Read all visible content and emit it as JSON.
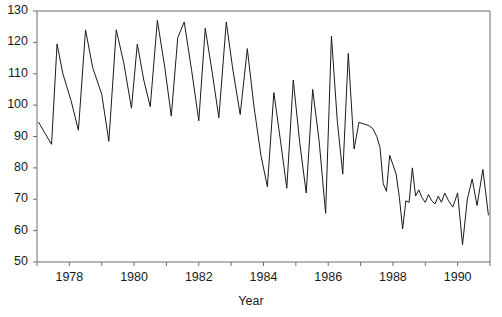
{
  "chart_data": {
    "type": "line",
    "title": "",
    "xlabel": "Year",
    "ylabel": "",
    "xlim": [
      1977.0,
      1991.0
    ],
    "ylim": [
      50,
      130
    ],
    "grid": false,
    "legend": null,
    "y_ticks": [
      50,
      60,
      70,
      80,
      90,
      100,
      110,
      120,
      130
    ],
    "x_ticks_major": [
      1978,
      1980,
      1982,
      1984,
      1986,
      1988,
      1990
    ],
    "x_ticks_minor": [
      1977,
      1979,
      1981,
      1983,
      1985,
      1987,
      1989,
      1991
    ],
    "x_tick_labels": [
      "1978",
      "1980",
      "1982",
      "1984",
      "1986",
      "1988",
      "1990"
    ],
    "y_tick_labels": [
      "50",
      "60",
      "70",
      "80",
      "90",
      "100",
      "110",
      "120",
      "130"
    ],
    "line_color": "#1a1a1a",
    "line_width": 1.0,
    "series": [
      {
        "name": "series-1",
        "x": [
          1977.05,
          1977.25,
          1977.45,
          1977.62,
          1977.8,
          1978.05,
          1978.28,
          1978.5,
          1978.72,
          1979.0,
          1979.22,
          1979.45,
          1979.68,
          1979.92,
          1980.1,
          1980.3,
          1980.5,
          1980.72,
          1980.95,
          1981.15,
          1981.35,
          1981.55,
          1981.78,
          1982.0,
          1982.2,
          1982.42,
          1982.62,
          1982.85,
          1983.05,
          1983.28,
          1983.5,
          1983.7,
          1983.92,
          1984.12,
          1984.32,
          1984.52,
          1984.72,
          1984.92,
          1985.12,
          1985.32,
          1985.52,
          1985.72,
          1985.92,
          1986.1,
          1986.28,
          1986.45,
          1986.62,
          1986.8,
          1986.95,
          1987.1,
          1987.25,
          1987.38,
          1987.5,
          1987.6,
          1987.7,
          1987.8,
          1987.9,
          1988.0,
          1988.1,
          1988.2,
          1988.3,
          1988.4,
          1988.5,
          1988.6,
          1988.7,
          1988.8,
          1988.9,
          1989.0,
          1989.1,
          1989.2,
          1989.3,
          1989.4,
          1989.5,
          1989.6,
          1989.72,
          1989.85,
          1990.0,
          1990.15,
          1990.3,
          1990.45,
          1990.6,
          1990.78,
          1990.95
        ],
        "y": [
          94.5,
          91.0,
          87.5,
          119.5,
          110.0,
          101.5,
          92.0,
          124.0,
          112.0,
          103.5,
          88.5,
          124.0,
          113.5,
          99.0,
          119.5,
          108.0,
          99.5,
          127.0,
          112.0,
          96.5,
          121.5,
          126.5,
          111.0,
          95.0,
          124.5,
          110.0,
          96.0,
          126.5,
          111.5,
          97.0,
          118.0,
          100.0,
          84.0,
          74.0,
          104.0,
          89.0,
          73.5,
          108.0,
          88.0,
          72.0,
          105.0,
          88.5,
          65.5,
          122.0,
          95.0,
          78.0,
          116.5,
          86.0,
          94.5,
          94.0,
          93.5,
          92.5,
          90.0,
          86.5,
          75.0,
          72.5,
          84.0,
          81.0,
          78.0,
          70.5,
          60.5,
          69.5,
          69.0,
          80.0,
          71.0,
          73.0,
          70.5,
          69.0,
          71.5,
          69.5,
          68.5,
          71.0,
          69.0,
          72.0,
          69.5,
          67.5,
          72.0,
          55.5,
          70.0,
          76.5,
          68.0,
          79.5,
          65.0
        ]
      }
    ]
  },
  "axes": {
    "x_title": "Year",
    "y_title": ""
  }
}
